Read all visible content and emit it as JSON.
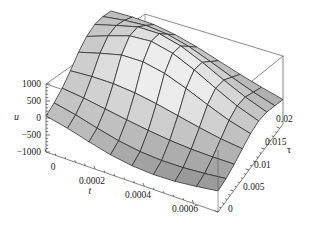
{
  "chart_data": {
    "type": "surface",
    "title": "",
    "xlabel": "t",
    "ylabel": "τ",
    "zlabel": "u",
    "xlim": [
      0,
      0.0007
    ],
    "ylim": [
      0,
      0.021
    ],
    "zlim": [
      -1000,
      1000
    ],
    "xticks": [
      "0",
      "0.0002",
      "0.0004",
      "0.0006"
    ],
    "xtick_values": [
      0,
      0.0002,
      0.0004,
      0.0006
    ],
    "yticks": [
      "0",
      "0.005",
      "0.01",
      "0.015",
      "0.02"
    ],
    "ytick_values": [
      0,
      0.005,
      0.01,
      0.015,
      0.02
    ],
    "zticks": [
      "1000",
      "500",
      "0",
      "−500",
      "−1000"
    ],
    "ztick_values": [
      1000,
      500,
      0,
      -500,
      -1000
    ],
    "grid": true,
    "legend": "none",
    "colormap": "grayscale",
    "mesh": true,
    "surface_samples": {
      "t": [
        0.0,
        8.75e-05,
        0.000175,
        0.0002625,
        0.00035,
        0.0004375,
        0.000525,
        0.0006125,
        0.0007
      ],
      "tau": [
        0.0,
        0.002625,
        0.00525,
        0.007875,
        0.0105,
        0.013125,
        0.01575,
        0.018375,
        0.021
      ],
      "u": [
        [
          60,
          120,
          230,
          420,
          640,
          780,
          810,
          720,
          560
        ],
        [
          -80,
          -10,
          160,
          470,
          830,
          1020,
          1000,
          830,
          600
        ],
        [
          -260,
          -180,
          60,
          480,
          1000,
          1240,
          1180,
          900,
          600
        ],
        [
          -420,
          -330,
          -40,
          430,
          1020,
          1300,
          1200,
          860,
          520
        ],
        [
          -520,
          -430,
          -130,
          330,
          900,
          1170,
          1060,
          720,
          380
        ],
        [
          -560,
          -470,
          -200,
          200,
          680,
          900,
          800,
          500,
          200
        ],
        [
          -540,
          -460,
          -240,
          70,
          420,
          580,
          500,
          260,
          20
        ],
        [
          -470,
          -410,
          -250,
          -40,
          180,
          280,
          220,
          40,
          -140
        ],
        [
          -380,
          -340,
          -240,
          -110,
          10,
          60,
          0,
          -140,
          -280
        ]
      ]
    }
  },
  "axes": {
    "z": {
      "label": "u",
      "ticks": [
        "1000",
        "500",
        "0",
        "−500",
        "−1000"
      ]
    },
    "x": {
      "label": "t",
      "ticks": [
        "0",
        "0.0002",
        "0.0004",
        "0.0006"
      ]
    },
    "y": {
      "label": "τ",
      "ticks": [
        "0",
        "0.005",
        "0.01",
        "0.015",
        "0.02"
      ]
    }
  },
  "colors": {
    "background": "#ffffff",
    "mesh_line": "#2b2b2b",
    "box_line": "#4a4a4a",
    "tick_text": "#1a1a1a",
    "surface_light": "#e2e2e2",
    "surface_mid": "#b0b0b0",
    "surface_dark": "#7d7d7d"
  }
}
